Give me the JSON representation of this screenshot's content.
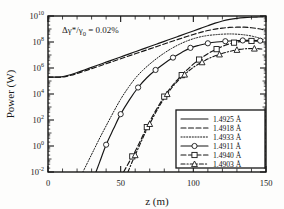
{
  "chart_data": {
    "type": "line",
    "title": "",
    "xlabel": "z (m)",
    "ylabel": "Power (W)",
    "xlim": [
      0,
      150
    ],
    "ylim_log10": [
      -2,
      10
    ],
    "yscale": "log",
    "xscale": "linear",
    "xticks": [
      "0",
      "50",
      "100",
      "150"
    ],
    "xtick_values": [
      0,
      50,
      100,
      150
    ],
    "xtick_minor_step": 10,
    "yticks": [
      "10-2",
      "100",
      "102",
      "104",
      "106",
      "108",
      "1010"
    ],
    "ytick_exponents": [
      "-2",
      "0",
      "2",
      "4",
      "6",
      "8",
      "10"
    ],
    "ytick_values_log10": [
      -2,
      0,
      2,
      4,
      6,
      8,
      10
    ],
    "grid": false,
    "legend_position": "lower-right",
    "annotations": [
      {
        "name": "energy-spread-annotation",
        "text_base": "Δγ*/γ",
        "text_sub": "0",
        "text_tail": " = 0.02%",
        "x": 20,
        "y_log10": 8.6
      }
    ],
    "series": [
      {
        "name": "1.4925 Å",
        "label": "1.4925 Å",
        "style": "solid",
        "marker": "none",
        "points_x": [
          0,
          3,
          6,
          9,
          12,
          16,
          20,
          25,
          30,
          35,
          40,
          45,
          50,
          55,
          60,
          65,
          70,
          75,
          80,
          85,
          90,
          95,
          100,
          105,
          110,
          115,
          120,
          125,
          130,
          135,
          140,
          145,
          148
        ],
        "points_y_log10": [
          5.3,
          5.3,
          5.3,
          5.32,
          5.38,
          5.5,
          5.65,
          5.85,
          6.05,
          6.25,
          6.45,
          6.65,
          6.85,
          7.05,
          7.25,
          7.45,
          7.65,
          7.85,
          8.05,
          8.25,
          8.45,
          8.65,
          8.85,
          9.05,
          9.25,
          9.45,
          9.62,
          9.74,
          9.82,
          9.87,
          9.9,
          9.92,
          9.93
        ]
      },
      {
        "name": "1.4918 Å",
        "label": "1.4918 Å",
        "style": "dashed",
        "marker": "none",
        "points_x": [
          0,
          3,
          6,
          9,
          12,
          16,
          20,
          25,
          30,
          35,
          40,
          45,
          50,
          55,
          60,
          65,
          70,
          75,
          80,
          85,
          90,
          95,
          100,
          105,
          110,
          115,
          120,
          125,
          130,
          135,
          140,
          145,
          148
        ],
        "points_y_log10": [
          5.3,
          5.3,
          5.3,
          5.3,
          5.34,
          5.44,
          5.58,
          5.76,
          5.95,
          6.14,
          6.33,
          6.52,
          6.71,
          6.9,
          7.09,
          7.28,
          7.47,
          7.66,
          7.85,
          8.04,
          8.22,
          8.4,
          8.58,
          8.74,
          8.88,
          8.99,
          9.07,
          9.12,
          9.14,
          9.14,
          9.1,
          9.02,
          8.95
        ]
      },
      {
        "name": "1.4933 Å",
        "label": "1.4933 Å",
        "style": "dotted",
        "marker": "none",
        "points_x": [
          24,
          28,
          32,
          36,
          40,
          45,
          50,
          55,
          60,
          65,
          70,
          75,
          80,
          85,
          90,
          95,
          100,
          105,
          110,
          115,
          120,
          125,
          130,
          135,
          140,
          145,
          148
        ],
        "points_y_log10": [
          -2.0,
          -1.1,
          -0.2,
          0.7,
          1.55,
          2.6,
          3.6,
          4.45,
          5.2,
          5.8,
          6.3,
          6.75,
          7.15,
          7.5,
          7.8,
          8.05,
          8.25,
          8.4,
          8.5,
          8.56,
          8.6,
          8.62,
          8.6,
          8.55,
          8.46,
          8.32,
          8.2
        ]
      },
      {
        "name": "1.4911 Å",
        "label": "1.4911 Å",
        "style": "solid",
        "marker": "circle",
        "points_x": [
          33,
          36,
          40,
          45,
          50,
          56,
          62,
          68,
          74,
          80,
          86,
          92,
          98,
          104,
          110,
          116,
          122,
          128,
          134,
          140,
          146
        ],
        "points_y_log10": [
          -2.0,
          -1.1,
          0.1,
          1.3,
          2.45,
          3.55,
          4.5,
          5.25,
          5.85,
          6.35,
          6.8,
          7.2,
          7.55,
          7.75,
          7.9,
          8.0,
          8.06,
          8.1,
          8.12,
          8.13,
          8.1
        ],
        "marker_x": [
          40,
          50,
          62,
          74,
          86,
          98,
          110,
          122,
          134,
          146
        ],
        "marker_y_log10": [
          0.1,
          2.45,
          4.5,
          5.85,
          6.8,
          7.55,
          7.9,
          8.06,
          8.12,
          8.1
        ]
      },
      {
        "name": "1.4940 Å",
        "label": "1.4940 Å",
        "style": "dashed",
        "marker": "square",
        "points_x": [
          52,
          56,
          60,
          64,
          68,
          74,
          80,
          86,
          92,
          98,
          104,
          110,
          116,
          122,
          128,
          134,
          140,
          146
        ],
        "points_y_log10": [
          -2.0,
          -1.2,
          -0.4,
          0.5,
          1.45,
          2.7,
          3.8,
          4.7,
          5.45,
          6.1,
          6.65,
          7.1,
          7.45,
          7.75,
          7.95,
          8.05,
          8.08,
          8.05
        ],
        "marker_x": [
          58,
          68,
          80,
          92,
          104,
          116,
          128,
          140
        ],
        "marker_y_log10": [
          -0.8,
          1.45,
          3.8,
          5.45,
          6.65,
          7.45,
          7.95,
          8.08
        ]
      },
      {
        "name": "1.4903 Å",
        "label": "1.4903 Å",
        "style": "dashdot",
        "marker": "triangle",
        "points_x": [
          55,
          58,
          62,
          66,
          70,
          76,
          82,
          88,
          94,
          100,
          106,
          112,
          118,
          124,
          130,
          136,
          142,
          148
        ],
        "points_y_log10": [
          -2.0,
          -1.2,
          -0.2,
          0.8,
          1.7,
          2.95,
          4.0,
          4.85,
          5.5,
          6.05,
          6.45,
          6.8,
          7.05,
          7.25,
          7.4,
          7.48,
          7.5,
          7.45
        ],
        "marker_x": [
          60,
          70,
          82,
          94,
          106,
          118,
          130,
          142
        ],
        "marker_y_log10": [
          -0.7,
          1.7,
          4.0,
          5.5,
          6.45,
          7.05,
          7.4,
          7.5
        ]
      }
    ]
  },
  "legend": {
    "entries": [
      {
        "label": "1.4925 Å",
        "style": "solid",
        "marker": "none"
      },
      {
        "label": "1.4918 Å",
        "style": "dashed",
        "marker": "none"
      },
      {
        "label": "1.4933 Å",
        "style": "dotted",
        "marker": "none"
      },
      {
        "label": "1.4911 Å",
        "style": "solid",
        "marker": "circle"
      },
      {
        "label": "1.4940 Å",
        "style": "dashed",
        "marker": "square"
      },
      {
        "label": "1.4903 Å",
        "style": "dashdot",
        "marker": "triangle"
      }
    ]
  },
  "colors": {
    "line": "#161616",
    "background": "#fdfdfc",
    "text": "#1a1a1a"
  }
}
